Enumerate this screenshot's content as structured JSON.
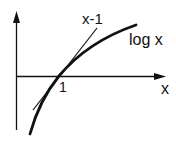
{
  "diagram": {
    "labels": {
      "line": "x-1",
      "curve": "log x",
      "x_axis": "x",
      "tick": "1"
    },
    "colors": {
      "stroke": "#111111",
      "background": "#ffffff"
    }
  }
}
